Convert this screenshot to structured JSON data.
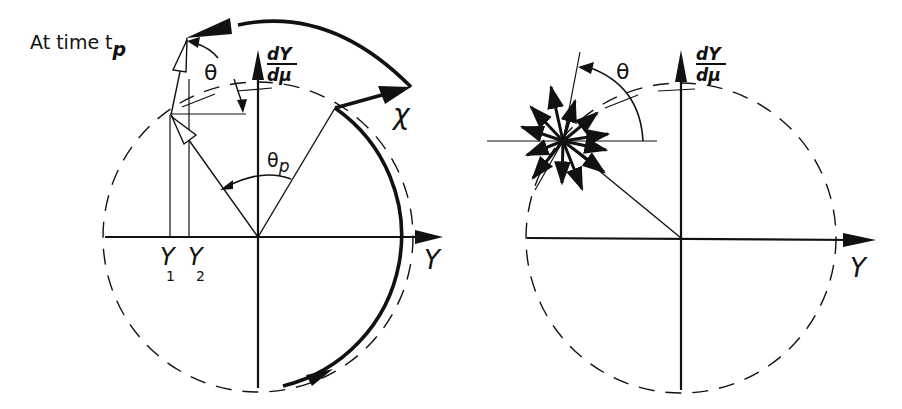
{
  "left_diagram": {
    "title": "At time t",
    "title_subscript": "p",
    "vertical_axis_label_num": "dY",
    "vertical_axis_label_den": "dμ",
    "horizontal_axis_label": "Y",
    "angle_theta": "θ",
    "angle_theta_p_base": "θ",
    "angle_theta_p_sub": "p",
    "chi_label": "χ",
    "y1_base": "Y",
    "y1_sub": "1",
    "y2_base": "Y",
    "y2_sub": "2"
  },
  "right_diagram": {
    "vertical_axis_label_num": "dY",
    "vertical_axis_label_den": "dμ",
    "horizontal_axis_label": "Y",
    "angle_theta": "θ"
  },
  "colors": {
    "ink": "#111111",
    "background": "#ffffff"
  }
}
